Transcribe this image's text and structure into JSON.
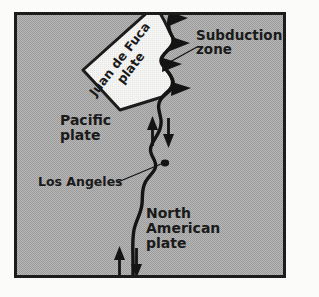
{
  "figure": {
    "type": "tectonic-plate-map",
    "background_color": "#a9a9a9",
    "border_color": "#1c1c1c",
    "outer_color": "#fbfbfa",
    "ink_color": "#141414",
    "inset_fill": "#f2f2f0"
  },
  "labels": {
    "juan_de_fuca": {
      "lines": [
        "Juan de Fuca",
        "plate"
      ],
      "line1": "Juan de Fuca",
      "line2": "plate",
      "rotation_deg": -52,
      "style": "bold"
    },
    "subduction_zone": {
      "lines": [
        "Subduction",
        "zone"
      ],
      "line1": "Subduction",
      "line2": "zone",
      "style": "bold"
    },
    "pacific_plate": {
      "lines": [
        "Pacific",
        "plate"
      ],
      "line1": "Pacific",
      "line2": "plate",
      "style": "bold"
    },
    "los_angeles": {
      "text": "Los Angeles",
      "style": "bold"
    },
    "north_american_plate": {
      "lines": [
        "North",
        "American",
        "plate"
      ],
      "line1": "North",
      "line2": "American",
      "line3": "plate",
      "style": "bold"
    }
  },
  "features": {
    "transform_fault": "San Andreas strike-slip fault trace",
    "subduction_barbs_count": 4,
    "strike_slip_arrow_pairs": 2,
    "city_marker": "Los Angeles"
  }
}
